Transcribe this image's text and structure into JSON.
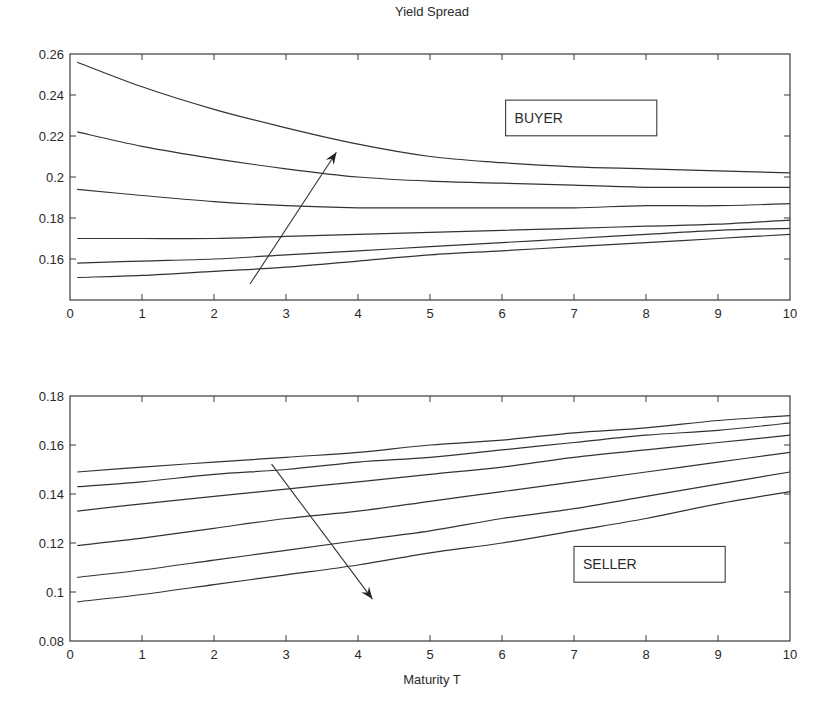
{
  "figure": {
    "title": "Yield Spread",
    "xlabel": "Maturity T"
  },
  "chart_data": [
    {
      "type": "line",
      "name": "buyer-panel",
      "title": "Yield Spread",
      "xlabel": "",
      "ylabel": "",
      "xlim": [
        0,
        10
      ],
      "ylim": [
        0.14,
        0.26
      ],
      "xticks": [
        0,
        1,
        2,
        3,
        4,
        5,
        6,
        7,
        8,
        9,
        10
      ],
      "xtick_labels": [
        "0",
        "1",
        "2",
        "3",
        "4",
        "5",
        "6",
        "7",
        "8",
        "9",
        "10"
      ],
      "yticks": [
        0.16,
        0.18,
        0.2,
        0.22,
        0.24,
        0.26
      ],
      "ytick_labels": [
        "0.16",
        "0.18",
        "0.2",
        "0.22",
        "0.24",
        "0.26"
      ],
      "grid": false,
      "annotation_box": {
        "text": "BUYER",
        "x": 6.05,
        "y": 0.2375,
        "x2": 8.15,
        "y2": 0.2201
      },
      "arrow": {
        "from": [
          2.5,
          0.1478
        ],
        "to": [
          3.7,
          0.2121
        ],
        "direction": "increasing"
      },
      "x": [
        0.1,
        1,
        2,
        3,
        4,
        5,
        6,
        7,
        8,
        9,
        10
      ],
      "series": [
        {
          "name": "curve-1",
          "values": [
            0.256,
            0.244,
            0.233,
            0.224,
            0.216,
            0.21,
            0.207,
            0.205,
            0.204,
            0.203,
            0.202
          ]
        },
        {
          "name": "curve-2",
          "values": [
            0.222,
            0.215,
            0.209,
            0.204,
            0.2,
            0.198,
            0.197,
            0.196,
            0.195,
            0.195,
            0.195
          ]
        },
        {
          "name": "curve-3",
          "values": [
            0.194,
            0.191,
            0.188,
            0.186,
            0.185,
            0.185,
            0.185,
            0.185,
            0.186,
            0.186,
            0.187
          ]
        },
        {
          "name": "curve-4",
          "values": [
            0.17,
            0.17,
            0.17,
            0.171,
            0.172,
            0.173,
            0.174,
            0.175,
            0.176,
            0.177,
            0.179
          ]
        },
        {
          "name": "curve-5",
          "values": [
            0.158,
            0.159,
            0.16,
            0.162,
            0.164,
            0.166,
            0.168,
            0.17,
            0.172,
            0.174,
            0.175
          ]
        },
        {
          "name": "curve-6",
          "values": [
            0.151,
            0.152,
            0.154,
            0.156,
            0.159,
            0.162,
            0.164,
            0.166,
            0.168,
            0.17,
            0.172
          ]
        }
      ]
    },
    {
      "type": "line",
      "name": "seller-panel",
      "title": "",
      "xlabel": "Maturity T",
      "ylabel": "",
      "xlim": [
        0,
        10
      ],
      "ylim": [
        0.08,
        0.18
      ],
      "xticks": [
        0,
        1,
        2,
        3,
        4,
        5,
        6,
        7,
        8,
        9,
        10
      ],
      "xtick_labels": [
        "0",
        "1",
        "2",
        "3",
        "4",
        "5",
        "6",
        "7",
        "8",
        "9",
        "10"
      ],
      "yticks": [
        0.08,
        0.1,
        0.12,
        0.14,
        0.16,
        0.18
      ],
      "ytick_labels": [
        "0.08",
        "0.1",
        "0.12",
        "0.14",
        "0.16",
        "0.18"
      ],
      "grid": false,
      "annotation_box": {
        "text": "SELLER",
        "x": 7.0,
        "y": 0.1186,
        "x2": 9.1,
        "y2": 0.104
      },
      "arrow": {
        "from": [
          2.8,
          0.1522
        ],
        "to": [
          4.2,
          0.0971
        ],
        "direction": "decreasing"
      },
      "x": [
        0.1,
        1,
        2,
        3,
        4,
        5,
        6,
        7,
        8,
        9,
        10
      ],
      "series": [
        {
          "name": "curve-1",
          "values": [
            0.149,
            0.151,
            0.153,
            0.155,
            0.157,
            0.16,
            0.162,
            0.165,
            0.167,
            0.17,
            0.172
          ]
        },
        {
          "name": "curve-2",
          "values": [
            0.143,
            0.145,
            0.148,
            0.15,
            0.153,
            0.155,
            0.158,
            0.161,
            0.164,
            0.166,
            0.169
          ]
        },
        {
          "name": "curve-3",
          "values": [
            0.133,
            0.136,
            0.139,
            0.142,
            0.145,
            0.148,
            0.151,
            0.155,
            0.158,
            0.161,
            0.164
          ]
        },
        {
          "name": "curve-4",
          "values": [
            0.119,
            0.122,
            0.126,
            0.13,
            0.133,
            0.137,
            0.141,
            0.145,
            0.149,
            0.153,
            0.157
          ]
        },
        {
          "name": "curve-5",
          "values": [
            0.106,
            0.109,
            0.113,
            0.117,
            0.121,
            0.125,
            0.13,
            0.134,
            0.139,
            0.144,
            0.149
          ]
        },
        {
          "name": "curve-6",
          "values": [
            0.096,
            0.099,
            0.103,
            0.107,
            0.111,
            0.116,
            0.12,
            0.125,
            0.13,
            0.136,
            0.141
          ]
        }
      ]
    }
  ]
}
